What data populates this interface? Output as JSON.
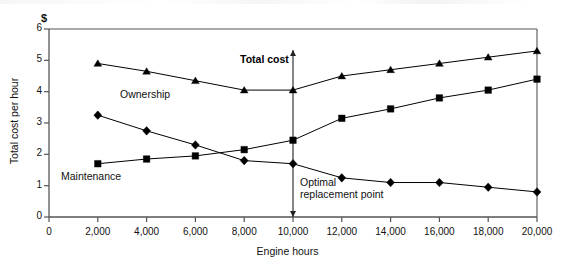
{
  "chart_data": {
    "type": "line",
    "title": "",
    "xlabel": "Engine hours",
    "ylabel": "Total cost per hour",
    "y_unit_symbol": "$",
    "xlim": [
      0,
      20000
    ],
    "ylim": [
      0,
      6
    ],
    "grid": false,
    "legend_position": "inline-annotations",
    "x": [
      2000,
      4000,
      6000,
      8000,
      10000,
      12000,
      14000,
      16000,
      18000,
      20000
    ],
    "xticks": [
      0,
      2000,
      4000,
      6000,
      8000,
      10000,
      12000,
      14000,
      16000,
      18000,
      20000
    ],
    "xtick_labels": [
      "0",
      "2,000",
      "4,000",
      "6,000",
      "8,000",
      "10,000",
      "12,000",
      "14,000",
      "16,000",
      "18,000",
      "20,000"
    ],
    "yticks": [
      0,
      1,
      2,
      3,
      4,
      5,
      6
    ],
    "ytick_labels": [
      "0",
      "1",
      "2",
      "3",
      "4",
      "5",
      "6"
    ],
    "series": [
      {
        "name": "Total cost",
        "marker": "triangle",
        "values": [
          4.9,
          4.65,
          4.35,
          4.05,
          4.05,
          4.5,
          4.7,
          4.9,
          5.1,
          5.3
        ]
      },
      {
        "name": "Maintenance",
        "marker": "square",
        "values": [
          1.7,
          1.85,
          1.95,
          2.15,
          2.45,
          3.15,
          3.45,
          3.8,
          4.05,
          4.4
        ]
      },
      {
        "name": "Ownership",
        "marker": "diamond",
        "values": [
          3.25,
          2.75,
          2.3,
          1.8,
          1.7,
          1.25,
          1.1,
          1.1,
          0.95,
          0.8
        ]
      }
    ],
    "annotations": [
      {
        "name": "total-cost",
        "text": "Total cost",
        "bold": true
      },
      {
        "name": "ownership",
        "text": "Ownership",
        "bold": false
      },
      {
        "name": "maintenance",
        "text": "Maintenance",
        "bold": false
      },
      {
        "name": "optimal-replacement-point",
        "text_line1": "Optimal",
        "text_line2": "replacement point",
        "bold": false,
        "marker_x": 10000,
        "vertical_line": true
      }
    ],
    "colors": {
      "line": "#000000",
      "marker": "#000000",
      "axis": "#555555",
      "background": "#ffffff"
    }
  },
  "axes": {
    "y_unit": "$",
    "ytick_0": "0",
    "ytick_1": "1",
    "ytick_2": "2",
    "ytick_3": "3",
    "ytick_4": "4",
    "ytick_5": "5",
    "ytick_6": "6",
    "xtick_0": "0",
    "xtick_1": "2,000",
    "xtick_2": "4,000",
    "xtick_3": "6,000",
    "xtick_4": "8,000",
    "xtick_5": "10,000",
    "xtick_6": "12,000",
    "xtick_7": "14,000",
    "xtick_8": "16,000",
    "xtick_9": "18,000",
    "xtick_10": "20,000",
    "x_title": "Engine hours",
    "y_title": "Total cost per hour"
  },
  "labels": {
    "total_cost": "Total cost",
    "ownership": "Ownership",
    "maintenance": "Maintenance",
    "optimal_line1": "Optimal",
    "optimal_line2": "replacement point"
  }
}
